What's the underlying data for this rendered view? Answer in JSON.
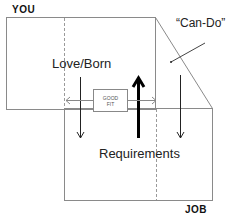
{
  "labels": {
    "you": "YOU",
    "job": "JOB",
    "love_born": "Love/Born",
    "can_do": "“Can-Do”",
    "requirements": "Requirements",
    "good_fit_line1": "GOOD",
    "good_fit_line2": "FIT"
  },
  "colors": {
    "outline": "#8a8a8a",
    "dashed": "#9a9a9a",
    "arrow": "#222222",
    "thick_arrow": "#000000",
    "text": "#222222"
  }
}
